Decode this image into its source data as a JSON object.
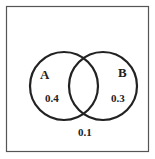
{
  "diagram": {
    "type": "venn",
    "sets": [
      {
        "name": "A",
        "region_value": "0.4"
      },
      {
        "name": "B",
        "region_value": "0.3"
      }
    ],
    "intersection_value": "",
    "outside_value": "0.1"
  },
  "colors": {
    "stroke": "#222222",
    "frame": "#555555",
    "background": "#ffffff"
  }
}
